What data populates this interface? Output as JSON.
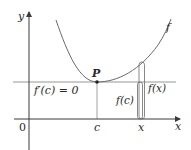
{
  "diagram": {
    "type": "graph-of-function-with-local-minimum",
    "axes": {
      "x_label": "x",
      "y_label": "y",
      "origin_label": "0"
    },
    "curve": {
      "label": "f"
    },
    "point": {
      "label": "P"
    },
    "ticks": {
      "c": "c",
      "x": "x"
    },
    "annotations": {
      "derivative": "f′(c) = 0",
      "f_c": "f(c)",
      "f_x": "f(x)"
    },
    "colors": {
      "curve": "#6a6a6a",
      "axes": "#3a3a3a",
      "guide": "#8a8a8a",
      "text": "#2a2a2a"
    }
  }
}
